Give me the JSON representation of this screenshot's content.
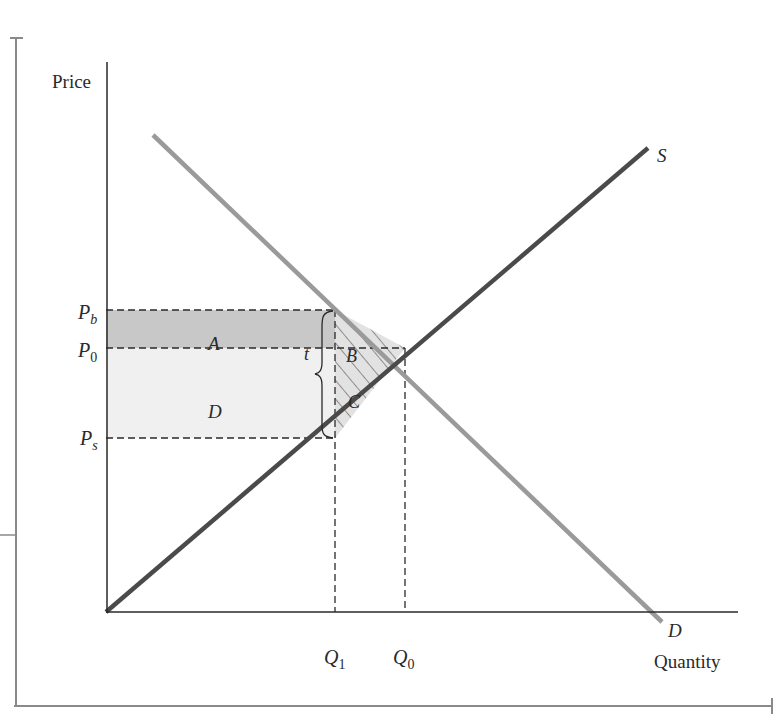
{
  "diagram": {
    "type": "supply-demand-tax-incidence",
    "axes": {
      "y_label": "Price",
      "x_label": "Quantity"
    },
    "price_levels": [
      {
        "id": "Pb",
        "base": "P",
        "sub": "b"
      },
      {
        "id": "P0",
        "base": "P",
        "sub": "0"
      },
      {
        "id": "Ps",
        "base": "P",
        "sub": "s"
      }
    ],
    "quantity_levels": [
      {
        "id": "Q1",
        "base": "Q",
        "sub": "1"
      },
      {
        "id": "Q0",
        "base": "Q",
        "sub": "0"
      }
    ],
    "curves": {
      "supply": {
        "label": "S",
        "color": "#4a4a4a"
      },
      "demand": {
        "label": "D",
        "color": "#9a9a9a"
      }
    },
    "regions": {
      "A": {
        "label": "A",
        "fill": "#c8c8c8"
      },
      "B": {
        "label": "B",
        "fill": "#e2e2e2"
      },
      "C": {
        "label": "C",
        "fill": "#e2e2e2"
      },
      "D": {
        "label": "D",
        "fill": "#f0f0f0"
      }
    },
    "tax": {
      "label": "t"
    }
  }
}
